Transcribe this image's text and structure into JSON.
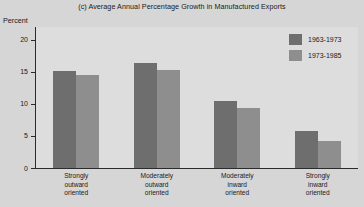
{
  "chart_data": {
    "type": "bar",
    "title": "(c) Average Annual Percentage Growth in Manufactured Exports",
    "xlabel": "",
    "ylabel": "Percent",
    "ylim": [
      0,
      22
    ],
    "yticks": [
      0,
      5,
      10,
      15,
      20
    ],
    "ytick_labels": [
      "0",
      "5",
      "10",
      "15",
      "20"
    ],
    "grid": false,
    "legend_position": "top-right",
    "categories": [
      "Strongly outward oriented",
      "Moderately outward oriented",
      "Moderately inward oriented",
      "Strongly inward oriented"
    ],
    "category_lines": [
      [
        "Strongly",
        "outward",
        "oriented"
      ],
      [
        "Moderately",
        "outward",
        "oriented"
      ],
      [
        "Moderately",
        "inward",
        "oriented"
      ],
      [
        "Strongly",
        "inward",
        "oriented"
      ]
    ],
    "series": [
      {
        "name": "1963-1973",
        "color": "#6e6e6e",
        "values": [
          15.1,
          16.4,
          10.5,
          5.8
        ]
      },
      {
        "name": "1973-1985",
        "color": "#8e8e8e",
        "values": [
          14.5,
          15.3,
          9.3,
          4.2
        ]
      }
    ]
  },
  "legend": {
    "items": [
      {
        "label": "1963-1973",
        "swatch": "series-1-swatch"
      },
      {
        "label": "1973-1985",
        "swatch": "series-2-swatch"
      }
    ]
  }
}
